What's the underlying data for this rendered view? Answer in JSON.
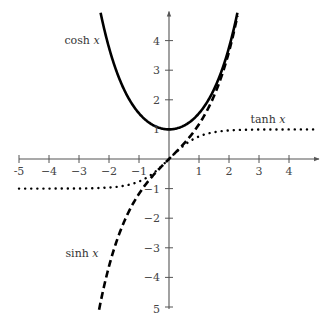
{
  "chart_data": {
    "type": "line",
    "title": "",
    "xlabel": "",
    "ylabel": "",
    "xlim": [
      -5,
      5
    ],
    "ylim": [
      -5,
      5
    ],
    "grid": false,
    "x_ticks": [
      -5,
      -4,
      -3,
      -2,
      -1,
      1,
      2,
      3,
      4
    ],
    "x_tick_labels": [
      "-5",
      "−4",
      "−3",
      "−2",
      "−1",
      "1",
      "2",
      "3",
      "4"
    ],
    "y_ticks": [
      4,
      3,
      2,
      1,
      -1,
      -2,
      -3,
      -4,
      -5
    ],
    "y_tick_labels": [
      "4",
      "3",
      "2",
      "1",
      "−1",
      "−2",
      "−3",
      "−4",
      "5"
    ],
    "series": [
      {
        "name": "cosh x",
        "label_fn": "cosh",
        "label_var": "x",
        "function": "cosh",
        "domain": [
          -2.28,
          2.28
        ],
        "style": "solid",
        "color": "#000000"
      },
      {
        "name": "sinh x",
        "label_fn": "sinh",
        "label_var": "x",
        "function": "sinh",
        "domain": [
          -2.33,
          2.28
        ],
        "style": "dashed",
        "color": "#000000"
      },
      {
        "name": "tanh x",
        "label_fn": "tanh",
        "label_var": "x",
        "function": "tanh",
        "domain": [
          -5,
          5
        ],
        "style": "dotted",
        "color": "#000000"
      }
    ],
    "annotations": [
      {
        "text": "cosh x",
        "series": "cosh x",
        "at": [
          -2.9,
          3.9
        ]
      },
      {
        "text": "tanh x",
        "series": "tanh x",
        "at": [
          3.3,
          1.2
        ]
      },
      {
        "text": "sinh x",
        "series": "sinh x",
        "at": [
          -2.9,
          -3.3
        ]
      }
    ]
  }
}
